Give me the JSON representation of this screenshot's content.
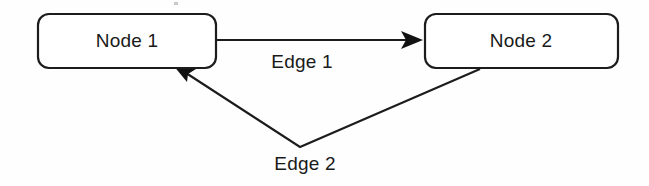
{
  "diagram": {
    "background_color": "#fefefe",
    "stroke_color": "#1c1c1c",
    "text_color": "#1a1a1a",
    "nodes": [
      {
        "id": "node-1",
        "label": "Node 1",
        "x": 38,
        "y": 14,
        "width": 178,
        "height": 54,
        "corner_radius": 11
      },
      {
        "id": "node-2",
        "label": "Node 2",
        "x": 425,
        "y": 14,
        "width": 193,
        "height": 54,
        "corner_radius": 11
      }
    ],
    "edges": [
      {
        "id": "edge-1",
        "label": "Edge 1",
        "from": "node-1",
        "to": "node-2",
        "direction": "left-to-right",
        "shape": "straight",
        "label_x": 302,
        "label_y": 68,
        "path": "M 217 40 L 412 40",
        "arrow_points": "423,40 401,31 406,40 401,49"
      },
      {
        "id": "edge-2",
        "label": "Edge 2",
        "from": "node-2",
        "to": "node-1",
        "direction": "right-to-left",
        "shape": "v-polyline",
        "label_x": 305,
        "label_y": 170,
        "vertex_x": 300,
        "vertex_y": 147,
        "path": "M 480 69 L 300 147 L 186 73",
        "arrow_points": "173,65 196,69 188,74 187,82"
      }
    ]
  }
}
